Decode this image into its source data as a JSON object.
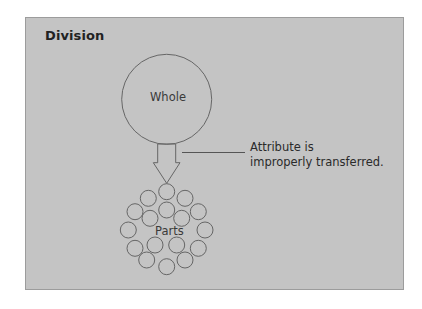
{
  "title": "Division",
  "whole": {
    "label": "Whole",
    "cx": 166.7,
    "cy": 99.3,
    "r": 45
  },
  "parts": {
    "label": "Parts",
    "circle_radius": 8,
    "count": 17
  },
  "arrow": {
    "direction": "down"
  },
  "annotation": {
    "line1": "Attribute is",
    "line2": "improperly transferred."
  },
  "colors": {
    "background": "#ffffff",
    "panel": "#c4c4c4",
    "panel_border": "#9c9c9c",
    "stroke": "#666666",
    "text": "#2a2a2a"
  }
}
